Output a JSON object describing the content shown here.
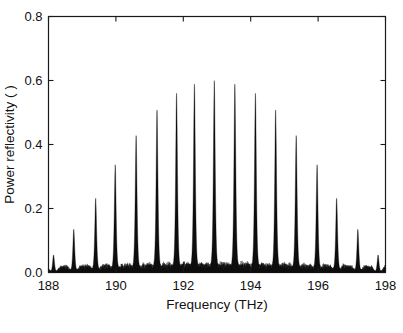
{
  "chart_data": {
    "type": "line",
    "title": "",
    "xlabel": "Frequency (THz)",
    "ylabel": "Power reflectivity ( )",
    "xlim": [
      188,
      198
    ],
    "ylim": [
      0.0,
      0.8
    ],
    "xticks": [
      188,
      190,
      192,
      194,
      196,
      198
    ],
    "xticklabels": [
      "188",
      "190",
      "192",
      "194",
      "196",
      "198"
    ],
    "yticks": [
      0.0,
      0.2,
      0.4,
      0.6,
      0.8
    ],
    "yticklabels": [
      "0.0",
      "0.2",
      "0.4",
      "0.6",
      "0.8"
    ],
    "grid": false,
    "legend": null,
    "series": [
      {
        "name": "power reflectivity",
        "description": "Comb of narrow reflection resonances with a gaussian-like envelope centred near 192.9 THz; broadband low-level sidelobe noise at ~0.01-0.05 between the peaks.",
        "peaks": [
          {
            "x": 188.15,
            "y": 0.055
          },
          {
            "x": 188.75,
            "y": 0.135
          },
          {
            "x": 189.4,
            "y": 0.232
          },
          {
            "x": 189.98,
            "y": 0.337
          },
          {
            "x": 190.6,
            "y": 0.428
          },
          {
            "x": 191.22,
            "y": 0.508
          },
          {
            "x": 191.8,
            "y": 0.56
          },
          {
            "x": 192.33,
            "y": 0.589
          },
          {
            "x": 192.92,
            "y": 0.6
          },
          {
            "x": 193.53,
            "y": 0.589
          },
          {
            "x": 194.14,
            "y": 0.56
          },
          {
            "x": 194.74,
            "y": 0.508
          },
          {
            "x": 195.35,
            "y": 0.428
          },
          {
            "x": 195.97,
            "y": 0.337
          },
          {
            "x": 196.55,
            "y": 0.232
          },
          {
            "x": 197.18,
            "y": 0.135
          },
          {
            "x": 197.78,
            "y": 0.055
          }
        ],
        "peak_half_width_THz": 0.035,
        "baseline_noise_level": 0.012,
        "sidelobe_max": 0.05
      }
    ]
  },
  "axes": {
    "x_title": "Frequency (THz)",
    "y_title": "Power reflectivity ( )"
  }
}
